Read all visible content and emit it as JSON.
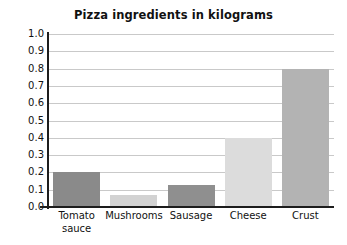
{
  "chart_data": {
    "type": "bar",
    "title": "Pizza ingredients in kilograms",
    "xlabel": "",
    "ylabel": "",
    "categories": [
      "Tomato sauce",
      "Mushrooms",
      "Sausage",
      "Cheese",
      "Crust"
    ],
    "values": [
      0.2,
      0.07,
      0.13,
      0.4,
      0.8
    ],
    "ylim": [
      0.0,
      1.0
    ],
    "ytick_labels": [
      "1.0",
      "0.9",
      "0.8",
      "0.7",
      "0.6",
      "0.5",
      "0.4",
      "0.3",
      "0.2",
      "0.1",
      "0.0"
    ],
    "ytick_values": [
      1.0,
      0.9,
      0.8,
      0.7,
      0.6,
      0.5,
      0.4,
      0.3,
      0.2,
      0.1,
      0.0
    ],
    "grid": true,
    "grid_axis": "y",
    "legend": false,
    "legend_position": "none",
    "bar_colors": [
      "#8a8a8a",
      "#d2d2d2",
      "#8f8f8f",
      "#dcdcdc",
      "#b3b3b3"
    ],
    "grid_color": "#c9c9c9",
    "axis_color": "#1d1d1d",
    "background_color": "#ffffff",
    "text_color": "#111111",
    "category_label_lines": [
      [
        "Tomato",
        "sauce"
      ],
      [
        "Mushrooms"
      ],
      [
        "Sausage"
      ],
      [
        "Cheese"
      ],
      [
        "Crust"
      ]
    ]
  }
}
